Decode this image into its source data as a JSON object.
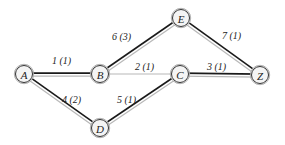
{
  "diagram": {
    "type": "weighted-graph",
    "nodes": [
      {
        "id": "A",
        "label": "A",
        "x": 24,
        "y": 74
      },
      {
        "id": "B",
        "label": "B",
        "x": 100,
        "y": 74
      },
      {
        "id": "E",
        "label": "E",
        "x": 181,
        "y": 18
      },
      {
        "id": "C",
        "label": "C",
        "x": 180,
        "y": 74
      },
      {
        "id": "Z",
        "label": "Z",
        "x": 260,
        "y": 75
      },
      {
        "id": "D",
        "label": "D",
        "x": 100,
        "y": 128
      }
    ],
    "edges": [
      {
        "from": "A",
        "to": "B",
        "label": "1 (1)",
        "style": "double",
        "lx": 52,
        "ly": 64
      },
      {
        "from": "B",
        "to": "E",
        "label": "6 (3)",
        "style": "double",
        "lx": 112,
        "ly": 40
      },
      {
        "from": "E",
        "to": "Z",
        "label": "7 (1)",
        "style": "double",
        "lx": 222,
        "ly": 39
      },
      {
        "from": "B",
        "to": "C",
        "label": "2 (1)",
        "style": "single",
        "lx": 135,
        "ly": 70
      },
      {
        "from": "C",
        "to": "Z",
        "label": "3 (1)",
        "style": "double",
        "lx": 207,
        "ly": 70
      },
      {
        "from": "A",
        "to": "D",
        "label": "4 (2)",
        "style": "double",
        "lx": 62,
        "ly": 103
      },
      {
        "from": "D",
        "to": "C",
        "label": "5 (1)",
        "style": "double",
        "lx": 117,
        "ly": 103
      }
    ],
    "colors": {
      "dark_stroke": "#1a1a1a",
      "light_stroke": "#b8b8b8",
      "node_fill": "#f4f4f4",
      "node_stroke": "#333333"
    }
  }
}
